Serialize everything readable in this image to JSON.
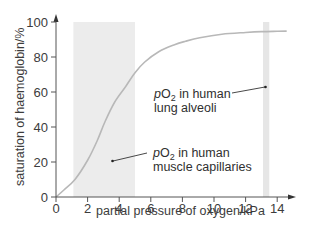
{
  "chart_data": {
    "type": "line",
    "title": "",
    "xlabel": "partial pressure of oxygen/kPa",
    "ylabel": "saturation of haemoglobin/%",
    "xlim": [
      0,
      15
    ],
    "ylim": [
      0,
      100
    ],
    "x_ticks": [
      0,
      2,
      4,
      6,
      8,
      10,
      12,
      14
    ],
    "y_ticks": [
      0,
      20,
      40,
      60,
      80,
      100
    ],
    "grid": false,
    "legend": null,
    "series": [
      {
        "name": "oxygen dissociation curve",
        "color": "#b8b8b8",
        "x": [
          0,
          0.5,
          1.2,
          2.0,
          2.6,
          3.1,
          3.7,
          4.4,
          5.0,
          5.6,
          6.5,
          7.5,
          8.2,
          9.1,
          10.5,
          12.0,
          13.0,
          14.0,
          14.6
        ],
        "y": [
          0,
          4,
          10,
          21,
          32,
          43,
          54,
          63,
          71,
          77,
          83,
          87,
          89,
          91,
          93,
          94,
          94.5,
          94.7,
          94.8
        ]
      }
    ],
    "shaded_regions": [
      {
        "name": "muscle-capillaries-band",
        "x_start": 1.1,
        "x_end": 5.0,
        "color": "#ececec"
      },
      {
        "name": "lung-alveoli-band",
        "x_start": 13.1,
        "x_end": 13.5,
        "color": "#e6e6e6"
      }
    ],
    "annotations": [
      {
        "name": "lung-alveoli",
        "line1_prefix": "pO",
        "line1_sub": "2",
        "line1_suffix": " in human",
        "line2": "lung alveoli",
        "points_to": {
          "x": 13.3,
          "y": 63
        }
      },
      {
        "name": "muscle-capillaries",
        "line1_prefix": "pO",
        "line1_sub": "2",
        "line1_suffix": " in human",
        "line2": "muscle capillaries",
        "points_to": {
          "x": 3.5,
          "y": 20
        }
      }
    ]
  },
  "labels": {
    "x_ticks": [
      "0",
      "2",
      "4",
      "6",
      "8",
      "10",
      "12",
      "14"
    ],
    "y_ticks": [
      "0",
      "20",
      "40",
      "60",
      "80",
      "100"
    ]
  }
}
